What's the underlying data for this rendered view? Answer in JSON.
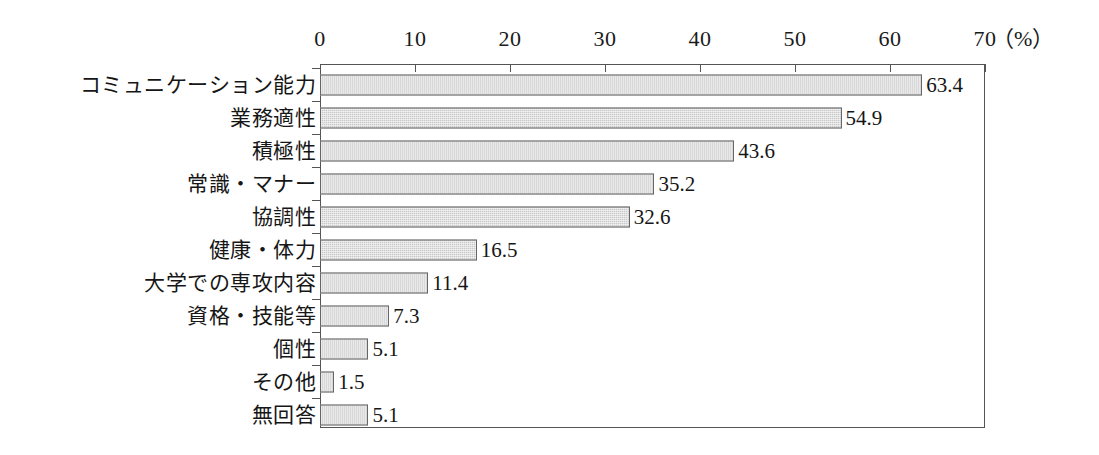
{
  "chart_data": {
    "type": "bar",
    "orientation": "horizontal",
    "title": "",
    "xlabel": "",
    "ylabel": "",
    "unit_label": "（%）",
    "xlim": [
      0,
      70
    ],
    "xticks": [
      0,
      10,
      20,
      30,
      40,
      50,
      60,
      70
    ],
    "xtick_labels": [
      "0",
      "10",
      "20",
      "30",
      "40",
      "50",
      "60",
      "70"
    ],
    "grid": false,
    "legend": false,
    "bar_fill_color": "#c9c9c9",
    "bar_border_color": "#666666",
    "axis_color": "#555555",
    "categories": [
      "コミュニケーション能力",
      "業務適性",
      "積極性",
      "常識・マナー",
      "協調性",
      "健康・体力",
      "大学での専攻内容",
      "資格・技能等",
      "個性",
      "その他",
      "無回答"
    ],
    "values": [
      63.4,
      54.9,
      43.6,
      35.2,
      32.6,
      16.5,
      11.4,
      7.3,
      5.1,
      1.5,
      5.1
    ],
    "value_labels": [
      "63.4",
      "54.9",
      "43.6",
      "35.2",
      "32.6",
      "16.5",
      "11.4",
      "7.3",
      "5.1",
      "1.5",
      "5.1"
    ]
  }
}
